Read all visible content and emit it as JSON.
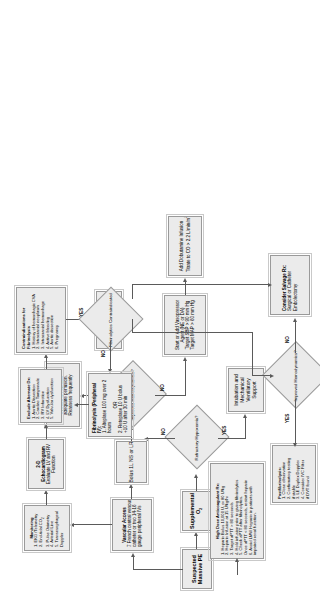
{
  "diagram": {
    "orientation": "rotated-90",
    "nodes": {
      "suspected_pe": {
        "title": "Suspected",
        "line2": "Massive PE"
      },
      "supplemental_o2": {
        "title": "Supplemental O2"
      },
      "refractory_hypoxemia": {
        "label": "Refractory Hypoxemia?"
      },
      "intubation": {
        "l1": "Intubation and",
        "l2": "Mechanical",
        "l3": "Ventilatory",
        "l4": "Support"
      },
      "vascular_access": {
        "title": "Vascular Access",
        "l1": "7 French central venous",
        "l2": "catheter or two 14-16",
        "l3": "gauge peripheral IVs"
      },
      "bolus": {
        "title": "Bolus 1L NS or LR"
      },
      "improved_hemo_1": {
        "label": "Improved Hemodynamics?"
      },
      "additional_fluid": {
        "l1": "Additional fluid boluses as",
        "l2": "needed to maintain",
        "l3": "adequate perfusion.",
        "l4": "Reassess frequently"
      },
      "vasopressor": {
        "l1": "Start or Add Vasopressor",
        "l2": "Agent (NE or DA)",
        "l3": "Target SBP > 90 mm Hg",
        "l4": "Target MAP > 60 mm Hg"
      },
      "dobutamine": {
        "l1": "Add Dobutamine Infusion",
        "l2": "Titrate to CO > 2.2 L/min/m2"
      },
      "cardiopulmonary_arrest": {
        "title": "Cardiopulmonary Arrest",
        "l1": "ACLS Protocol"
      },
      "monitoring": {
        "title": "Monitoring",
        "items": [
          "1. EKG /Telemetry",
          "2. End-tidal CO2",
          "3. Pulse Oximetry",
          "4. Arterial Line",
          "5. Transesophageal",
          "    Doppler"
        ]
      },
      "echo": {
        "title": "2-D Echocardiogram",
        "l1": "Evaluate LV and RV",
        "l2": "Function"
      },
      "exclude_alternate_dx": {
        "title": "Exclude Alternate Dx:",
        "items": [
          "1. Aortic Dissection",
          "2. Cardiac Tamponade",
          "3. RV Infarction",
          "4. LV Dysfunction",
          "5. Valvular dysfunction"
        ]
      },
      "contraindications": {
        "title": "Contraindications for Fibrinolysis",
        "items": [
          "1. History of hemorrhagic CVA",
          "2. Intracranial neoplasm",
          "3. Intracranial hemorrhage",
          "4. Active bleeding",
          "5. Aortic dissection",
          "6. Pregnancy"
        ]
      },
      "fibrinolytics_contraindicated": {
        "label": "Fibrinolytics Contraindicated"
      },
      "fibrinolysis": {
        "title": "Fibrinolysis (Peripheral IV):",
        "l1": "1. Alteplase 100 mg over 2",
        "l2": "    hours",
        "or": "OR",
        "l3": "2. Reteplase 10 U bolus",
        "l4": "    +10 U after 30 min"
      },
      "high_dose_anticoagulant": {
        "title": "High Dose Anticoagulant Rx:",
        "items": [
          "1. Heparin Bolus 10,000 U, or 80 U/kg",
          "2. Heparin Infusion at 15 U/kg/hr",
          "3. Target aPTT > 80 seconds",
          "4. Hold infusion prior to giving fibrinolytics",
          "5. Check aPTT after fibrinolytics.",
          "Once aPTT < 80 seconds, restart heparin",
          "6. Avoid LMW Heparin in patients with",
          "impaired renal function."
        ]
      },
      "postfibrinolysis": {
        "title": "Postfibrinolysis:",
        "items": [
          "1. Close observation",
          "2. Confirmatory testing",
          "if stable",
          "3. LE Duplex Doppler",
          "4. Consider IVC Filter",
          "if DVT found"
        ]
      },
      "improved_hemo_2": {
        "label": "Improved Hemodynamics?"
      },
      "salvage": {
        "title": "Consider Salvage Rx:",
        "l1": "Surgical or Catheter",
        "l2": "Embolectomy"
      }
    },
    "edge_labels": {
      "yes1": "YES",
      "no1": "NO",
      "yes2": "YES",
      "no2": "NO",
      "yes3": "YES",
      "no3": "NO",
      "yes4": "YES",
      "no4": "NO"
    },
    "colors": {
      "node_fill": "#ebebeb",
      "node_border": "#9a9a9a",
      "connector": "#5a5a5a",
      "background": "#ffffff"
    }
  }
}
